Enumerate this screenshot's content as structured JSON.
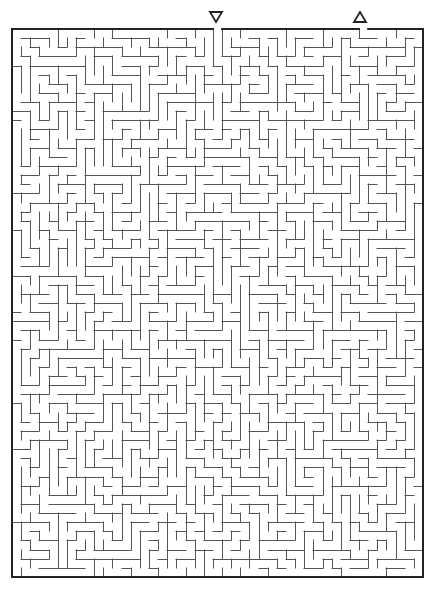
{
  "puzzle": {
    "type": "maze",
    "grid": {
      "cols": 45,
      "rows": 60,
      "cell_size_px": 9.13
    },
    "bounds": {
      "left": 12,
      "top": 29,
      "right": 423,
      "bottom": 577
    },
    "entrance": {
      "label": "start",
      "icon": "triangle-down-icon",
      "x": 216,
      "col_index": 22
    },
    "exit": {
      "label": "finish",
      "icon": "triangle-up-icon",
      "x": 360,
      "col_index": 38
    },
    "colors": {
      "wall": "#555555",
      "border": "#222222",
      "background": "#ffffff"
    },
    "seed": 7351
  }
}
